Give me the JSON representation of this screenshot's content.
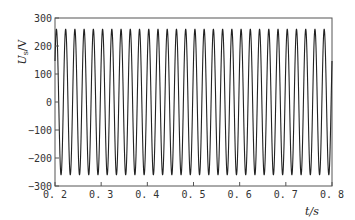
{
  "chart_data": {
    "type": "line",
    "title": "",
    "xlabel": "t/s",
    "ylabel": "Us/V",
    "ylabel_main": "U",
    "ylabel_sub": "s",
    "ylabel_unit": "/V",
    "xlim": [
      0.2,
      0.8
    ],
    "ylim": [
      -300,
      300
    ],
    "x_ticks": [
      0.2,
      0.3,
      0.4,
      0.5,
      0.6,
      0.7,
      0.8
    ],
    "x_tick_labels": [
      "0. 2",
      "0. 3",
      "0. 4",
      "0. 5",
      "0. 6",
      "0. 7",
      "0. 8"
    ],
    "y_ticks": [
      300,
      200,
      100,
      0,
      -100,
      -200,
      -300
    ],
    "y_tick_labels": [
      "300",
      "200",
      "100",
      "0",
      "−100",
      "−200",
      "−300"
    ],
    "grid": false,
    "legend": null,
    "series": [
      {
        "name": "Us",
        "description": "Sinusoidal voltage waveform, ~50 Hz, amplitude ~260 V",
        "frequency_hz": 50,
        "amplitude_v": 260,
        "x_start": 0.2,
        "x_end": 0.8,
        "color": "#222222"
      }
    ]
  }
}
